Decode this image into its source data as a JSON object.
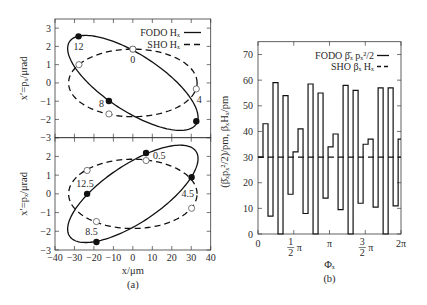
{
  "figure": {
    "captions": {
      "a": "(a)",
      "b": "(b)"
    }
  },
  "chart_data": [
    {
      "id": "phase-space-top",
      "type": "scatter",
      "panel": "a-top",
      "ylabel": "x′=pₓ/μrad",
      "xlim": [
        -40,
        40
      ],
      "ylim": [
        -3,
        3.5
      ],
      "grid": false,
      "legend_position": "top-right",
      "xticks": [
        {
          "value": -40
        },
        {
          "value": -30
        },
        {
          "value": -20
        },
        {
          "value": -10
        },
        {
          "value": 0
        },
        {
          "value": 10
        },
        {
          "value": 20
        },
        {
          "value": 30
        },
        {
          "value": 40
        }
      ],
      "yticks": [
        {
          "value": -3,
          "label": "−3"
        },
        {
          "value": -2,
          "label": "−2"
        },
        {
          "value": -1,
          "label": "−1"
        },
        {
          "value": 0,
          "label": "0"
        },
        {
          "value": 1,
          "label": "1"
        },
        {
          "value": 2,
          "label": "2"
        },
        {
          "value": 3,
          "label": "3"
        }
      ],
      "legend": [
        {
          "label": "FODO Hₓ",
          "style": "solid"
        },
        {
          "label": "SHO Hₓ",
          "style": "dashed"
        }
      ],
      "series": [
        {
          "name": "FODO Hₓ",
          "style": "solid",
          "marker": "filled",
          "ellipse": {
            "x_amplitude": 33.5,
            "xp_amplitude": 2.6,
            "phase_rad": 3.9
          },
          "points": [
            {
              "label": "0",
              "x": 0,
              "xp": 1.85,
              "label_pos": "below"
            },
            {
              "label": "4",
              "x": 32.6,
              "xp": -2.1,
              "label_pos": "above-right"
            },
            {
              "label": "8",
              "x": -12.3,
              "xp": -0.99,
              "label_pos": "left"
            },
            {
              "label": "12",
              "x": -27.9,
              "xp": 2.55,
              "label_pos": "below"
            }
          ]
        },
        {
          "name": "SHO Hₓ",
          "style": "dashed",
          "marker": "open",
          "ellipse": {
            "x_amplitude": 33,
            "xp_amplitude": 1.85,
            "phase_rad": -1.5708
          },
          "points": [
            {
              "x": 0,
              "xp": 1.85
            },
            {
              "x": 32.6,
              "xp": -0.33
            },
            {
              "x": -12.3,
              "xp": -1.7
            },
            {
              "x": -27.7,
              "xp": 1.0
            }
          ]
        }
      ]
    },
    {
      "id": "phase-space-bottom",
      "type": "scatter",
      "panel": "a-bottom",
      "xlabel": "x/μm",
      "ylabel": "x′=pₓ/μrad",
      "xlim": [
        -40,
        40
      ],
      "ylim": [
        -3,
        3
      ],
      "grid": false,
      "xticks": [
        {
          "value": -40,
          "label": "−40"
        },
        {
          "value": -30,
          "label": "−30"
        },
        {
          "value": -20,
          "label": "−20"
        },
        {
          "value": -10,
          "label": "−10"
        },
        {
          "value": 0,
          "label": "0"
        },
        {
          "value": 10,
          "label": "10"
        },
        {
          "value": 20,
          "label": "20"
        },
        {
          "value": 30,
          "label": "30"
        },
        {
          "value": 40,
          "label": "40"
        }
      ],
      "yticks": [
        {
          "value": -3,
          "label": "−3"
        },
        {
          "value": -2,
          "label": "−2"
        },
        {
          "value": -1,
          "label": "−1"
        },
        {
          "value": 0,
          "label": "0"
        },
        {
          "value": 1,
          "label": "1"
        },
        {
          "value": 2,
          "label": "2"
        },
        {
          "value": 3
        }
      ],
      "series": [
        {
          "name": "FODO Hₓ",
          "style": "solid",
          "marker": "filled",
          "ellipse": {
            "x_amplitude": 33.5,
            "xp_amplitude": 2.6,
            "phase_rad": 0.76
          },
          "points": [
            {
              "label": "0.5",
              "x": 6.8,
              "xp": 2.18,
              "label_pos": "right"
            },
            {
              "label": "4.5",
              "x": 30.2,
              "xp": 0.89,
              "label_pos": "below-left"
            },
            {
              "label": "8.5",
              "x": -18.7,
              "xp": -2.57,
              "label_pos": "above-left"
            },
            {
              "label": "12.5",
              "x": -23.5,
              "xp": 0,
              "label_pos": "above"
            }
          ]
        },
        {
          "name": "SHO Hₓ",
          "style": "dashed",
          "marker": "open",
          "ellipse": {
            "x_amplitude": 33,
            "xp_amplitude": 1.85,
            "phase_rad": -1.5708
          },
          "points": [
            {
              "x": 6.8,
              "xp": 1.78
            },
            {
              "x": 30.2,
              "xp": -0.77
            },
            {
              "x": -18.7,
              "xp": -1.48
            },
            {
              "x": -23.5,
              "xp": 1.25
            }
          ]
        }
      ]
    },
    {
      "id": "step-plot",
      "type": "line",
      "panel": "b",
      "xlabel": "Φₓ",
      "ylabel": "(β̄ₓpₓ²/2)/pm, βₓHₓ/pm",
      "xlim_pi": [
        0,
        2
      ],
      "ylim": [
        0,
        75
      ],
      "grid": false,
      "legend_position": "top-right",
      "xticks": [
        {
          "value_pi": 0,
          "label": "0"
        },
        {
          "value_pi": 0.5,
          "numerator": "1",
          "denominator": "2",
          "label": "π"
        },
        {
          "value_pi": 1,
          "label": "π"
        },
        {
          "value_pi": 1.5,
          "numerator": "3",
          "denominator": "2",
          "label": "π"
        },
        {
          "value_pi": 2,
          "label": "2π"
        }
      ],
      "yticks": [
        {
          "value": 0,
          "label": "0"
        },
        {
          "value": 10,
          "label": "10"
        },
        {
          "value": 20,
          "label": "20"
        },
        {
          "value": 30,
          "label": "30"
        },
        {
          "value": 40,
          "label": "40"
        },
        {
          "value": 50,
          "label": "50"
        },
        {
          "value": 60,
          "label": "60"
        },
        {
          "value": 70,
          "label": "70"
        }
      ],
      "legend": [
        {
          "label": "FODO  β̄ₓ pₓ²/2",
          "style": "solid"
        },
        {
          "label": "SHO βₓ Hₓ",
          "style": "dashed"
        }
      ],
      "series": [
        {
          "name": "FODO β̄ₓ pₓ²/2",
          "style": "solid",
          "kind": "step",
          "step_width_pi": 0.07,
          "values": [
            30,
            43,
            7,
            59,
            0,
            54,
            15.5,
            32,
            41,
            8,
            58.5,
            0,
            55,
            14,
            34,
            39,
            9.5,
            58,
            0,
            56,
            12,
            35,
            37,
            10.5,
            57,
            0,
            57,
            11,
            37
          ]
        },
        {
          "name": "SHO βₓ Hₓ",
          "style": "dashed",
          "kind": "constant",
          "value": 30
        }
      ]
    }
  ]
}
